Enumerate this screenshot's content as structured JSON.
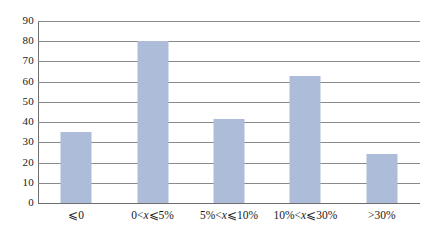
{
  "chart_data": {
    "type": "bar",
    "title": "",
    "subtitle": "",
    "xlabel": "",
    "ylabel": "",
    "categories": [
      "⩽0",
      "0<x⩽5%",
      "5%<x⩽10%",
      "10%<x⩽30%",
      ">30%"
    ],
    "category_parts": [
      {
        "pre": "⩽0",
        "var": "",
        "post": ""
      },
      {
        "pre": "0<",
        "var": "x",
        "post": "⩽5%"
      },
      {
        "pre": "5%<",
        "var": "x",
        "post": "⩽10%"
      },
      {
        "pre": "10%<",
        "var": "x",
        "post": "⩽30%"
      },
      {
        "pre": ">30%",
        "var": "",
        "post": ""
      }
    ],
    "values": [
      35,
      80,
      41.5,
      63,
      24
    ],
    "ylim": [
      0,
      90
    ],
    "yticks": [
      0,
      10,
      20,
      30,
      40,
      50,
      60,
      70,
      80,
      90
    ],
    "ytick_labels": [
      "0",
      "10",
      "20",
      "30",
      "40",
      "50",
      "60",
      "70",
      "80",
      "90"
    ],
    "grid": true,
    "grid_axis": "y",
    "legend": false,
    "legend_position": "none",
    "bar_color": "#adbcd9",
    "grid_color": "#8a8a8a",
    "axis_color": "#6e6e6e",
    "background_color": "#ffffff"
  }
}
